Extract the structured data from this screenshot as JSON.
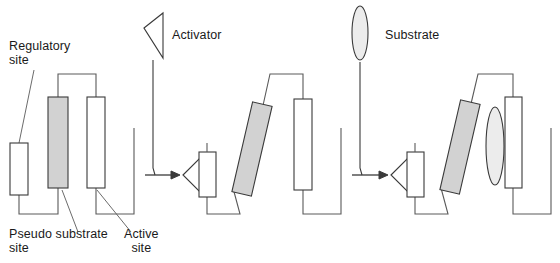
{
  "diagram": {
    "type": "schematic",
    "panel_count": 3,
    "labels": {
      "regulatory_site": "Regulatory\nsite",
      "pseudo_substrate_site": "Pseudo substrate\nsite",
      "active_site": "Active\nsite",
      "activator": "Activator",
      "substrate": "Substrate"
    },
    "colors": {
      "stroke": "#3a3a3a",
      "pseudo_substrate_fill": "#d2d2d2",
      "active_site_fill": "#ffffff",
      "regulatory_site_fill": "#ffffff",
      "substrate_fill": "#e8e8e8",
      "activator_fill": "#ffffff",
      "text": "#1a1a1a",
      "background": "#ffffff"
    },
    "legend_items": [
      {
        "name": "activator",
        "shape": "triangle",
        "label": "Activator"
      },
      {
        "name": "substrate",
        "shape": "ellipse",
        "label": "Substrate"
      }
    ],
    "panels": [
      {
        "id": "panel-1",
        "state": "inactive",
        "description": "Enzyme with pseudo substrate occupying the active site; regulatory site empty",
        "elements": [
          "regulatory-site-box",
          "pseudo-substrate-bar",
          "active-site-bar"
        ]
      },
      {
        "id": "panel-2",
        "state": "activator-bound",
        "description": "Activator bound to regulatory site; pseudo substrate tilted away from active site",
        "elements": [
          "activator-triangle",
          "regulatory-site-box",
          "pseudo-substrate-bar-tilted",
          "active-site-bar"
        ]
      },
      {
        "id": "panel-3",
        "state": "substrate-bound",
        "description": "Substrate bound in the vacated active site while activator remains bound",
        "elements": [
          "activator-triangle",
          "regulatory-site-box",
          "pseudo-substrate-bar-tilted",
          "substrate-ellipse",
          "active-site-bar"
        ]
      }
    ],
    "arrows": [
      {
        "name": "arrow-panel1-to-panel2",
        "direction": "right"
      },
      {
        "name": "arrow-panel2-to-panel3",
        "direction": "right"
      }
    ]
  }
}
